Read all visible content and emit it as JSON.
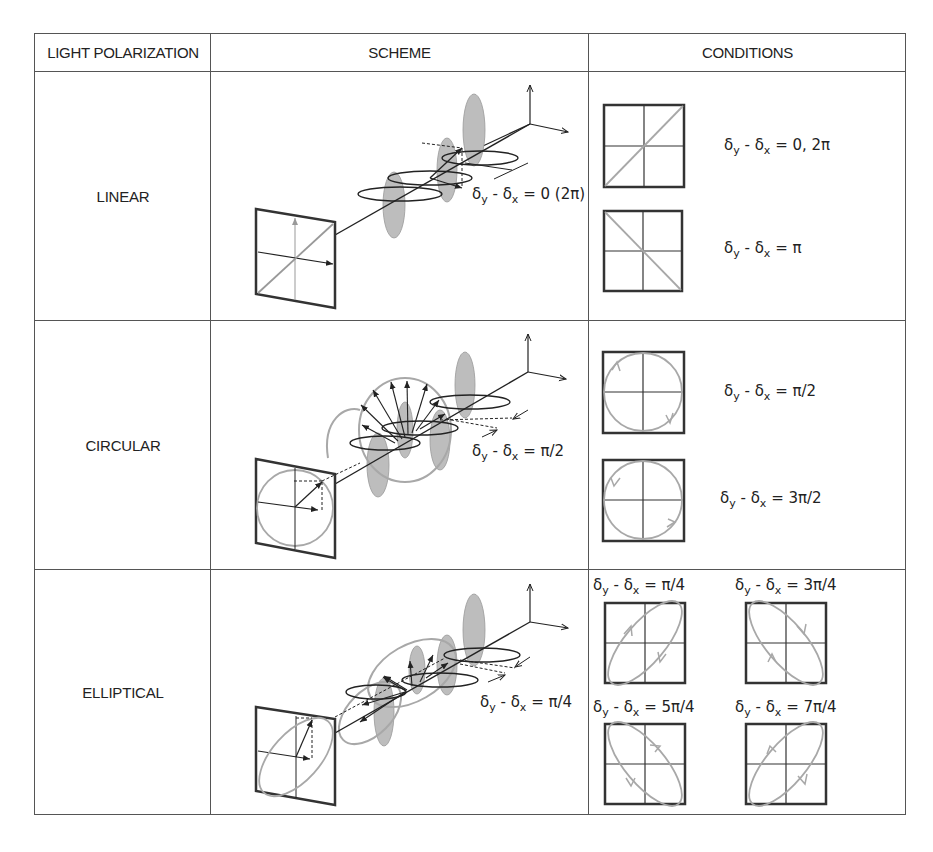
{
  "header": {
    "col1": "LIGHT POLARIZATION",
    "col2": "SCHEME",
    "col3": "CONDITIONS"
  },
  "rows": [
    {
      "label": "LINEAR",
      "scheme_equation": {
        "lhs": "δ",
        "sub1": "y",
        "mid": " - δ",
        "sub2": "x",
        "rhs": " = 0 (2π)"
      },
      "conditions": [
        {
          "lhs": "δ",
          "sub1": "y",
          "mid": " - δ",
          "sub2": "x",
          "rhs": " = 0, 2π",
          "figure": "diagonal-up-line"
        },
        {
          "lhs": "δ",
          "sub1": "y",
          "mid": " - δ",
          "sub2": "x",
          "rhs": " = π",
          "figure": "diagonal-down-line"
        }
      ]
    },
    {
      "label": "CIRCULAR",
      "scheme_equation": {
        "lhs": "δ",
        "sub1": "y",
        "mid": " - δ",
        "sub2": "x",
        "rhs": " = π/2"
      },
      "conditions": [
        {
          "lhs": "δ",
          "sub1": "y",
          "mid": " - δ",
          "sub2": "x",
          "rhs": " = π/2",
          "figure": "circle-clockwise"
        },
        {
          "lhs": "δ",
          "sub1": "y",
          "mid": " - δ",
          "sub2": "x",
          "rhs": " = 3π/2",
          "figure": "circle-counterclockwise"
        }
      ]
    },
    {
      "label": "ELLIPTICAL",
      "scheme_equation": {
        "lhs": "δ",
        "sub1": "y",
        "mid": " - δ",
        "sub2": "x",
        "rhs": " = π/4"
      },
      "conditions": [
        {
          "lhs": "δ",
          "sub1": "y",
          "mid": " - δ",
          "sub2": "x",
          "rhs": " = π/4",
          "figure": "ellipse-up-clockwise"
        },
        {
          "lhs": "δ",
          "sub1": "y",
          "mid": " - δ",
          "sub2": "x",
          "rhs": " = 3π/4",
          "figure": "ellipse-down-clockwise"
        },
        {
          "lhs": "δ",
          "sub1": "y",
          "mid": " - δ",
          "sub2": "x",
          "rhs": " = 5π/4",
          "figure": "ellipse-down-counterclockwise"
        },
        {
          "lhs": "δ",
          "sub1": "y",
          "mid": " - δ",
          "sub2": "x",
          "rhs": " = 7π/4",
          "figure": "ellipse-up-counterclockwise"
        }
      ]
    }
  ],
  "colors": {
    "border": "#555555",
    "ink": "#222222",
    "wave_fill": "#bdbdbd",
    "polarization_trace": "#a8a8a8"
  }
}
